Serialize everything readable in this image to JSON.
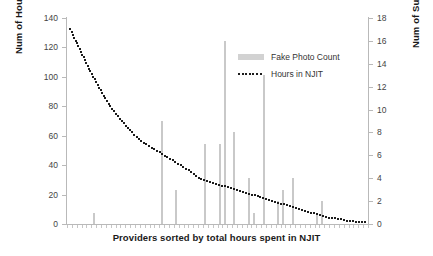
{
  "chart_data": {
    "type": "bar",
    "title": "",
    "xlabel": "Providers sorted by total hours spent in NJIT",
    "ylabel": "Num of Hours in NJIT",
    "y2label": "Num of Submitted Fake Photos",
    "ylim": [
      0,
      140
    ],
    "y2lim": [
      0,
      18
    ],
    "yticks": [
      140,
      120,
      100,
      80,
      60,
      40,
      20,
      0
    ],
    "y2ticks": [
      18,
      16,
      14,
      12,
      10,
      8,
      6,
      4,
      2,
      0
    ],
    "grid": false,
    "legend_position": "upper-right-inside",
    "legend": [
      "Fake Photo Count",
      "Hours in NJIT"
    ],
    "n_points": 62,
    "series": [
      {
        "name": "Fake Photo Count",
        "axis": "right",
        "render": "bar",
        "color": "#c9c9c9",
        "values": [
          0,
          0,
          0,
          0,
          0,
          1,
          0,
          0,
          0,
          0,
          0,
          0,
          0,
          0,
          0,
          0,
          0,
          0,
          0,
          9,
          0,
          0,
          3,
          0,
          0,
          0,
          0,
          0,
          7,
          0,
          0,
          7,
          16,
          0,
          8,
          0,
          0,
          4,
          1,
          0,
          13,
          0,
          0,
          2,
          3,
          0,
          4,
          0,
          0,
          0,
          0,
          1,
          2,
          0,
          0,
          0,
          0,
          0,
          0,
          0,
          0,
          0
        ]
      },
      {
        "name": "Hours in NJIT",
        "axis": "left",
        "render": "dotted-line",
        "color": "#1c1c1c",
        "values": [
          133,
          126,
          119,
          112,
          105,
          99,
          93,
          87,
          82,
          77,
          73,
          69,
          65,
          62,
          59,
          56,
          54,
          52,
          50,
          48,
          46,
          44,
          42,
          40,
          38,
          36,
          33,
          31,
          30,
          29,
          28,
          27,
          26,
          25,
          24,
          23,
          22,
          21,
          20,
          19,
          18,
          17,
          16,
          15,
          14,
          13,
          12,
          11,
          10,
          9,
          8,
          7,
          6,
          5,
          5,
          4,
          4,
          3,
          3,
          2,
          2,
          2
        ]
      }
    ]
  }
}
